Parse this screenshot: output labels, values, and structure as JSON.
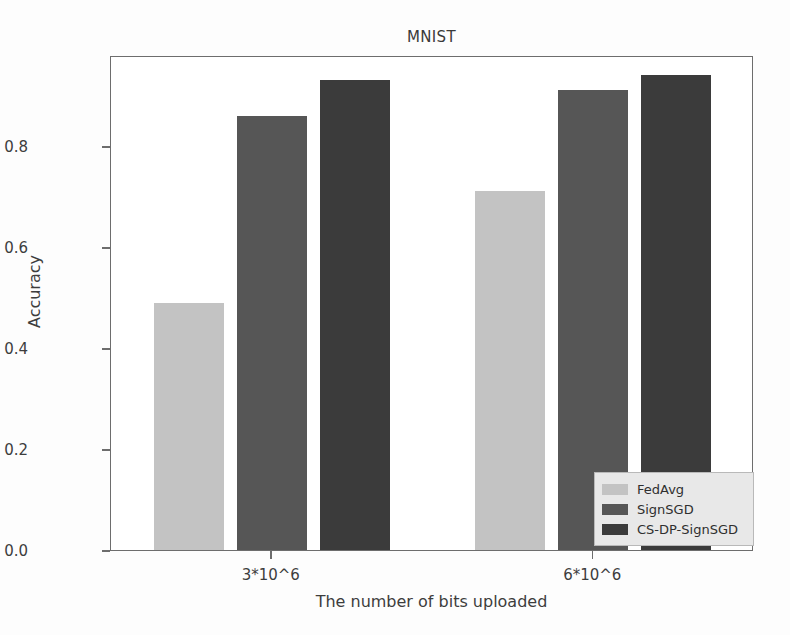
{
  "chart_data": {
    "type": "bar",
    "title": "MNIST",
    "xlabel": "The number of bits uploaded",
    "ylabel": "Accuracy",
    "categories": [
      "3*10^6",
      "6*10^6"
    ],
    "series": [
      {
        "name": "FedAvg",
        "values": [
          0.49,
          0.71
        ],
        "color": "#c3c3c3"
      },
      {
        "name": "SignSGD",
        "values": [
          0.86,
          0.91
        ],
        "color": "#565656"
      },
      {
        "name": "CS-DP-SignSGD",
        "values": [
          0.93,
          0.94
        ],
        "color": "#3b3b3b"
      }
    ],
    "ylim": [
      0.0,
      0.98
    ],
    "yticks": [
      "0.0",
      "0.2",
      "0.4",
      "0.6",
      "0.8"
    ],
    "ytick_values": [
      0.0,
      0.2,
      0.4,
      0.6,
      0.8
    ],
    "grid": false,
    "legend_position": "lower right",
    "legend_entries": [
      "FedAvg",
      "SignSGD",
      "CS-DP-SignSGD"
    ]
  },
  "figure": {
    "background_color": "#fdfdfd",
    "frame_color": "#6d6d6d"
  }
}
